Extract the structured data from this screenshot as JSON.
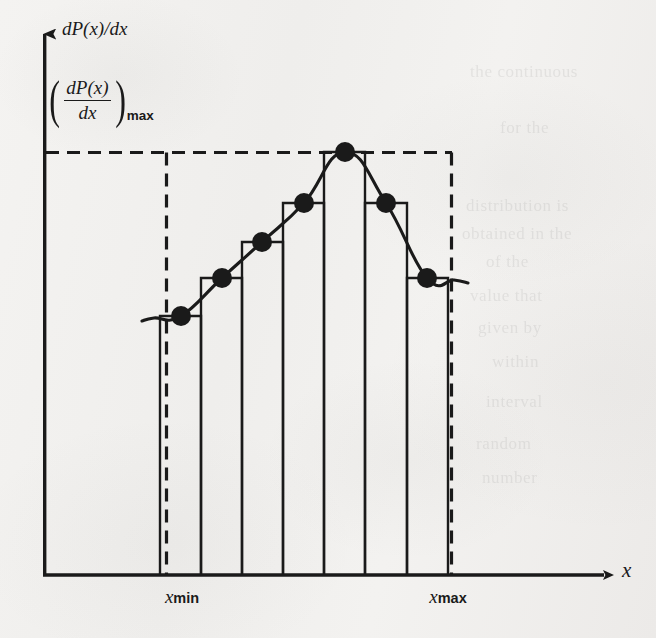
{
  "figure": {
    "kind": "probability-density-histogram",
    "background_color": "#f2f1ef",
    "ink_color": "#1a1a1a"
  },
  "axes": {
    "y_label": "dP(x)/dx",
    "x_label": "x",
    "origin_px": [
      43,
      575
    ],
    "x_axis_end_px": [
      612,
      575
    ],
    "y_axis_top_px": [
      43,
      22
    ]
  },
  "annotations": {
    "max_value": {
      "open_paren": "(",
      "numerator": "dP(x)",
      "denominator": "dx",
      "close_paren": ")",
      "subscript": "max"
    }
  },
  "ticks": [
    {
      "label_main": "x",
      "label_sub": "min",
      "x_px": 182
    },
    {
      "label_main": "x",
      "label_sub": "max",
      "x_px": 448
    }
  ],
  "chart_data": {
    "type": "bar",
    "title": "",
    "xlabel": "x",
    "ylabel": "dP(x)/dx",
    "grid": false,
    "legend": null,
    "x_range_label": [
      "x_min",
      "x_max"
    ],
    "categories": [
      "bin1",
      "bin2",
      "bin3",
      "bin4",
      "bin5",
      "bin6",
      "bin7"
    ],
    "values": [
      0.31,
      0.47,
      0.58,
      0.7,
      1.0,
      0.7,
      0.47
    ],
    "ylim": [
      0,
      1.08
    ],
    "y_reference_line": {
      "value": 1.0,
      "style": "dashed",
      "label": "(dP(x)/dx)_max"
    },
    "bin_edges_px": [
      160,
      201,
      242,
      283,
      324,
      365,
      407,
      448
    ],
    "bar_tops_px": [
      316,
      278,
      242,
      203,
      152,
      203,
      278
    ],
    "markers": [
      {
        "x_px": 181,
        "y_px": 316
      },
      {
        "x_px": 222,
        "y_px": 278
      },
      {
        "x_px": 262,
        "y_px": 242
      },
      {
        "x_px": 304,
        "y_px": 203
      },
      {
        "x_px": 345,
        "y_px": 152
      },
      {
        "x_px": 386,
        "y_px": 203
      },
      {
        "x_px": 427,
        "y_px": 278
      }
    ],
    "dashed_box_px": {
      "left": 166,
      "top": 152,
      "right": 452,
      "bottom": 575
    },
    "smooth_curve_note": "continuous density curve through bin-top midpoints, flat tails outside x_min/x_max"
  },
  "ghost_text": [
    {
      "text": "the continuous",
      "x": 470,
      "y": 62
    },
    {
      "text": "for the",
      "x": 500,
      "y": 118
    },
    {
      "text": "distribution is",
      "x": 466,
      "y": 196
    },
    {
      "text": "obtained in the",
      "x": 462,
      "y": 224
    },
    {
      "text": "of the",
      "x": 486,
      "y": 252
    },
    {
      "text": "value that",
      "x": 470,
      "y": 286
    },
    {
      "text": "given by",
      "x": 478,
      "y": 318
    },
    {
      "text": "within",
      "x": 492,
      "y": 352
    },
    {
      "text": "interval",
      "x": 486,
      "y": 392
    },
    {
      "text": "random",
      "x": 476,
      "y": 434
    },
    {
      "text": "number",
      "x": 482,
      "y": 468
    }
  ]
}
